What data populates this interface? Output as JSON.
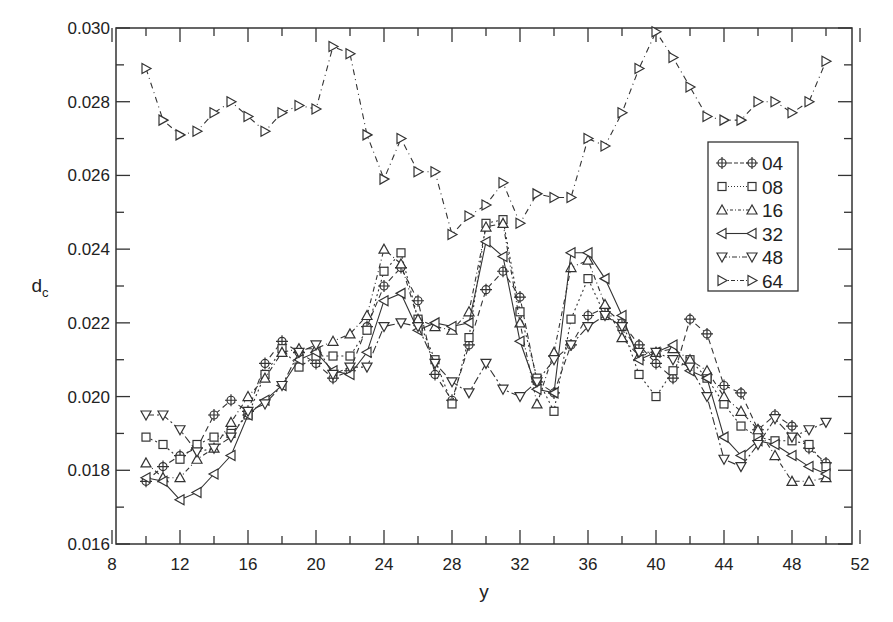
{
  "chart_data": {
    "type": "line",
    "title": "",
    "xlabel": "y",
    "ylabel": "d",
    "ylabel_subscript": "c",
    "xlim": [
      8,
      52
    ],
    "ylim": [
      0.016,
      0.03
    ],
    "xticks": [
      "8",
      "12",
      "16",
      "20",
      "24",
      "28",
      "32",
      "36",
      "40",
      "44",
      "48",
      "52"
    ],
    "yticks": [
      "0.016",
      "0.018",
      "0.020",
      "0.022",
      "0.024",
      "0.026",
      "0.028",
      "0.030"
    ],
    "grid": false,
    "legend_position": "right",
    "x": [
      10,
      11,
      12,
      13,
      14,
      15,
      16,
      17,
      18,
      19,
      20,
      21,
      22,
      23,
      24,
      25,
      26,
      27,
      28,
      29,
      30,
      31,
      32,
      33,
      34,
      35,
      36,
      37,
      38,
      39,
      40,
      41,
      42,
      43,
      44,
      45,
      46,
      47,
      48,
      49,
      50
    ],
    "series": [
      {
        "name": "04",
        "marker": "circle-plus",
        "dash": "6,4",
        "values": [
          0.0177,
          0.0181,
          0.0184,
          0.0186,
          0.0195,
          0.0199,
          0.0196,
          0.0209,
          0.0215,
          0.0212,
          0.0209,
          0.0205,
          0.0207,
          0.0219,
          0.023,
          0.0235,
          0.0226,
          0.0206,
          0.0199,
          0.0214,
          0.0229,
          0.0234,
          0.0227,
          0.0204,
          0.0201,
          0.0214,
          0.0222,
          0.0224,
          0.022,
          0.0214,
          0.0209,
          0.0205,
          0.0221,
          0.0217,
          0.0203,
          0.0201,
          0.0191,
          0.0195,
          0.0192,
          0.0186,
          0.0182
        ]
      },
      {
        "name": "08",
        "marker": "square",
        "dash": "2,3",
        "values": [
          0.0189,
          0.0187,
          0.0183,
          0.0187,
          0.0189,
          0.019,
          0.0195,
          0.0206,
          0.0213,
          0.0208,
          0.0211,
          0.0211,
          0.0211,
          0.0218,
          0.0234,
          0.0239,
          0.0221,
          0.021,
          0.0198,
          0.0216,
          0.0247,
          0.0248,
          0.0223,
          0.0205,
          0.0196,
          0.0221,
          0.0232,
          0.0222,
          0.0219,
          0.0206,
          0.02,
          0.0207,
          0.021,
          0.0205,
          0.0198,
          0.0192,
          0.0189,
          0.0188,
          0.0188,
          0.0187,
          0.0181
        ]
      },
      {
        "name": "16",
        "marker": "triangle-up",
        "dash": "5,3,1,3",
        "values": [
          0.0182,
          0.0178,
          0.0178,
          0.0183,
          0.0186,
          0.0193,
          0.02,
          0.0205,
          0.0212,
          0.0213,
          0.0213,
          0.0215,
          0.0217,
          0.0222,
          0.024,
          0.0236,
          0.0221,
          0.0219,
          0.0218,
          0.0223,
          0.0246,
          0.0247,
          0.022,
          0.0198,
          0.0212,
          0.0235,
          0.0237,
          0.0225,
          0.0216,
          0.0211,
          0.0212,
          0.0213,
          0.021,
          0.0207,
          0.02,
          0.0196,
          0.0191,
          0.0184,
          0.0177,
          0.0177,
          0.0178
        ]
      },
      {
        "name": "32",
        "marker": "triangle-left",
        "dash": "",
        "values": [
          0.0178,
          0.0177,
          0.0172,
          0.0174,
          0.0179,
          0.0184,
          0.0195,
          0.0199,
          0.0203,
          0.021,
          0.0212,
          0.0207,
          0.0206,
          0.0212,
          0.0226,
          0.0228,
          0.0218,
          0.022,
          0.0219,
          0.022,
          0.0242,
          0.0238,
          0.0215,
          0.0202,
          0.0201,
          0.0239,
          0.0239,
          0.0232,
          0.0222,
          0.021,
          0.0212,
          0.0214,
          0.0207,
          0.0205,
          0.0189,
          0.0184,
          0.0188,
          0.0187,
          0.0184,
          0.0181,
          0.0179
        ]
      },
      {
        "name": "48",
        "marker": "triangle-down",
        "dash": "8,3,2,3",
        "values": [
          0.0195,
          0.0195,
          0.0191,
          0.0185,
          0.0186,
          0.0189,
          0.0196,
          0.0198,
          0.0203,
          0.0212,
          0.0214,
          0.0206,
          0.0208,
          0.0208,
          0.0219,
          0.022,
          0.0219,
          0.0209,
          0.0204,
          0.0201,
          0.0209,
          0.0202,
          0.02,
          0.0204,
          0.021,
          0.0214,
          0.0219,
          0.0222,
          0.0219,
          0.0212,
          0.0212,
          0.021,
          0.0208,
          0.02,
          0.0183,
          0.0181,
          0.0187,
          0.0194,
          0.0189,
          0.0191,
          0.0193
        ]
      },
      {
        "name": "64",
        "marker": "triangle-right",
        "dash": "6,4,1,4",
        "values": [
          0.0289,
          0.0275,
          0.0271,
          0.0272,
          0.0277,
          0.028,
          0.0276,
          0.0272,
          0.0277,
          0.0279,
          0.0278,
          0.0295,
          0.0293,
          0.0271,
          0.0259,
          0.027,
          0.0261,
          0.0261,
          0.0244,
          0.0249,
          0.0252,
          0.0258,
          0.0247,
          0.0255,
          0.0254,
          0.0254,
          0.027,
          0.0268,
          0.0277,
          0.0289,
          0.0299,
          0.0292,
          0.0284,
          0.0276,
          0.0275,
          0.0275,
          0.028,
          0.028,
          0.0277,
          0.028,
          0.0291
        ]
      }
    ]
  }
}
